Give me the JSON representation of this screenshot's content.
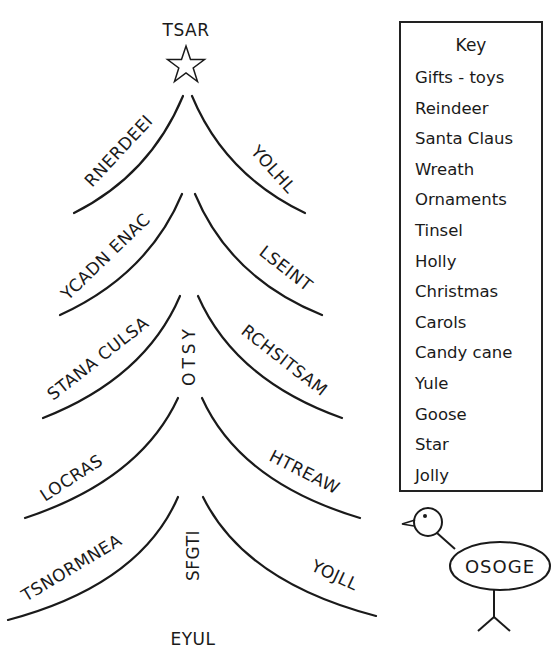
{
  "tree": {
    "top_word": "TSAR",
    "bottom_word": "EYUL",
    "trunk_words": [
      "OTSY",
      "SFGTI"
    ],
    "tiers": [
      {
        "left": "RNERDEEI",
        "right": "YOLHL"
      },
      {
        "left": "YCADN ENAC",
        "right": "LSEINT"
      },
      {
        "left": "STANA CULSA",
        "right": "RCHSITSAM"
      },
      {
        "left": "LOCRAS",
        "right": "HTREAW"
      },
      {
        "left": "TSNORMNEA",
        "right": "YOJLL"
      }
    ]
  },
  "key": {
    "title": "Key",
    "items": [
      "Gifts - toys",
      "Reindeer",
      "Santa Claus",
      "Wreath",
      "Ornaments",
      "Tinsel",
      "Holly",
      "Christmas",
      "Carols",
      "Candy cane",
      "Yule",
      "Goose",
      "Star",
      "Jolly"
    ]
  },
  "goose": {
    "word": "OSOGE"
  },
  "colors": {
    "ink": "#1a1a1a",
    "paper": "#ffffff"
  }
}
